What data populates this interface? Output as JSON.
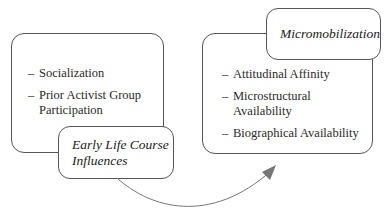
{
  "left_panel": {
    "title": "Early Life Course Influences",
    "title_lines": [
      "Early Life Course",
      "Influences"
    ],
    "items": [
      "Socialization",
      "Prior Activist Group Participation"
    ]
  },
  "right_panel": {
    "title": "Micromobilization",
    "items": [
      "Attitudinal Affinity",
      "Microstructural Availability",
      "Biographical Availability"
    ]
  },
  "connector": {
    "type": "curved-arrow",
    "from": "Early Life Course Influences",
    "to": "Micromobilization",
    "color": "#777777"
  }
}
